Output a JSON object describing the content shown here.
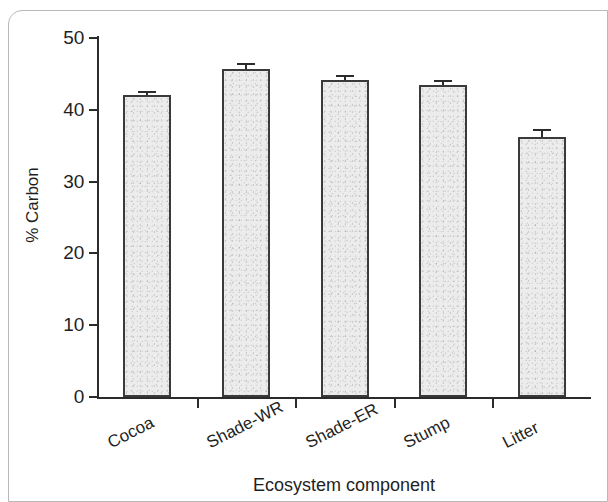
{
  "figure": {
    "frame_visible": true,
    "background_color": "#ffffff",
    "axis_color": "#2b2b2b",
    "bar_fill_color": "#ececec",
    "bar_edge_color": "#3a3a3a"
  },
  "chart_data": {
    "type": "bar",
    "title": "",
    "subtitle": "",
    "xlabel": "Ecosystem component",
    "ylabel": "% Carbon",
    "categories": [
      "Cocoa",
      "Shade-WR",
      "Shade-ER",
      "Stump",
      "Litter"
    ],
    "values": [
      42.1,
      45.7,
      44.1,
      43.4,
      36.2
    ],
    "errors": [
      0.5,
      0.8,
      0.8,
      0.7,
      1.1
    ],
    "error_type": "standard error",
    "ylim": [
      0,
      50
    ],
    "yticks": [
      0,
      10,
      20,
      30,
      40,
      50
    ],
    "ytick_labels": [
      "0",
      "10",
      "20",
      "30",
      "40",
      "50"
    ],
    "xtick_label_rotation_deg": -27,
    "grid": false,
    "legend": null,
    "legend_position": "none",
    "annotations": []
  },
  "axes": {
    "y_title": "% Carbon",
    "x_title": "Ecosystem component"
  }
}
